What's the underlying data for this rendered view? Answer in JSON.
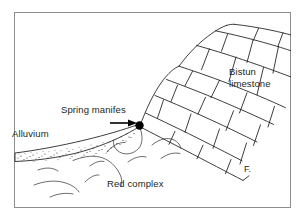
{
  "figure": {
    "kind": "geological-cross-section",
    "background_color": "#ffffff",
    "frame_color": "#8d8d8d",
    "line_color": "#1b1b1b",
    "text_color": "#231f20",
    "width": 305,
    "height": 221
  },
  "labels": {
    "bistun_line1": "Bistun",
    "bistun_line2": "limestone",
    "spring": "Spring manifes",
    "alluvium": "Alluvium",
    "red_complex": "Red complex",
    "fault": "F."
  },
  "units": [
    {
      "name": "Bistun limestone",
      "pattern": "blocky-bedded bricks",
      "position": "upper right, dipping down to the right"
    },
    {
      "name": "Alluvium",
      "pattern": "stippled wedge",
      "position": "left, thin wedge thickening toward the spring"
    },
    {
      "name": "Red complex",
      "pattern": "scattered wavy squiggles",
      "position": "lower left and center, beneath the limestone"
    }
  ],
  "annotations": [
    {
      "name": "spring-manifestation",
      "marker": "filled black dot with leader arrow pointing right",
      "label": "Spring manifes"
    },
    {
      "name": "fault-trace",
      "marker": "line labelled F. at the base of the limestone",
      "label": "F."
    }
  ]
}
